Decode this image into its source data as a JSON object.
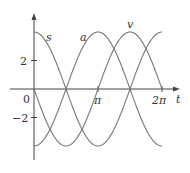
{
  "chart_data": {
    "type": "line",
    "title": "",
    "xlabel": "t",
    "ylabel": "",
    "x_ticks": [
      "0",
      "π",
      "2π"
    ],
    "y_ticks": [
      "2",
      "-2"
    ],
    "xlim": [
      0,
      6.2832
    ],
    "ylim": [
      -4,
      4
    ],
    "grid": false,
    "series": [
      {
        "name": "s",
        "formula": "4cos t",
        "x": [
          0,
          1.5708,
          3.1416,
          4.7124,
          6.2832
        ],
        "values": [
          4,
          0,
          -4,
          0,
          4
        ]
      },
      {
        "name": "v",
        "formula": "-4sin t",
        "x": [
          0,
          1.5708,
          3.1416,
          4.7124,
          6.2832
        ],
        "values": [
          0,
          -4,
          0,
          4,
          0
        ]
      },
      {
        "name": "a",
        "formula": "-4cos t",
        "x": [
          0,
          1.5708,
          3.1416,
          4.7124,
          6.2832
        ],
        "values": [
          -4,
          0,
          4,
          0,
          -4
        ]
      }
    ]
  },
  "labels": {
    "origin": "0",
    "pi": "π",
    "two_pi": "2π",
    "t": "t",
    "y2": "2",
    "yneg2": "−2",
    "s": "s",
    "a": "a",
    "v": "v"
  }
}
